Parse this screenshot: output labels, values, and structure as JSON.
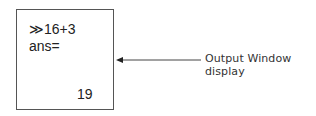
{
  "output_window": {
    "command": "≫16+3",
    "ans_label": "ans=",
    "result": "19"
  },
  "annotation": {
    "label": "Output Window display",
    "arrow_color": "#333333"
  }
}
